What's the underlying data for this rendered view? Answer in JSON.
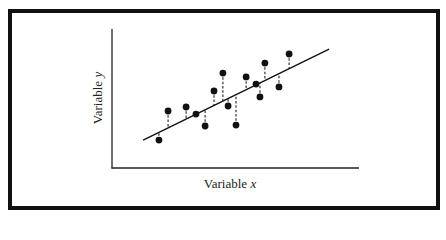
{
  "chart_data": {
    "type": "scatter",
    "title": "",
    "xlabel": "Variable x",
    "ylabel": "Variable y",
    "xlim": [
      0,
      100
    ],
    "ylim": [
      0,
      100
    ],
    "grid": false,
    "legend": null,
    "series": [
      {
        "name": "observations",
        "x": [
          19.0,
          22.7,
          30.0,
          34.0,
          37.7,
          41.3,
          44.9,
          47.0,
          50.2,
          54.3,
          58.3,
          59.9,
          61.9,
          67.6,
          71.7
        ],
        "y": [
          20.1,
          41.0,
          43.9,
          38.8,
          30.2,
          55.4,
          68.3,
          44.6,
          30.9,
          65.5,
          60.4,
          51.1,
          75.5,
          58.3,
          82.0
        ]
      }
    ],
    "regression_line": {
      "x": [
        12.6,
        87.9
      ],
      "y": [
        20.1,
        85.6
      ]
    },
    "annotations": [
      "dashed vertical residual lines from each point to the regression line"
    ]
  },
  "labels": {
    "x_axis": "Variable ",
    "x_var": "x",
    "y_axis": "Variable ",
    "y_var": "y"
  }
}
